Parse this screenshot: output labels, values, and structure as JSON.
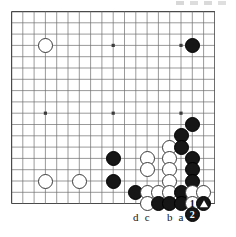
{
  "diagram": {
    "type": "go-board-problem-diagram",
    "board_size_columns": 19,
    "board_size_rows": 18,
    "visible_grid": {
      "cols": 19,
      "rows": 18
    },
    "background_color": "#ffffff",
    "line_color": "#6e6e6e",
    "border_color": "#4a4a4a",
    "black_color": "#161616",
    "white_color": "#ffffff"
  },
  "star_points": [
    {
      "col": 3,
      "row": 3
    },
    {
      "col": 9,
      "row": 3
    },
    {
      "col": 15,
      "row": 3
    },
    {
      "col": 3,
      "row": 9
    },
    {
      "col": 9,
      "row": 9
    },
    {
      "col": 15,
      "row": 9
    }
  ],
  "stones": [
    {
      "col": 3,
      "row": 3,
      "color": "white",
      "label": ""
    },
    {
      "col": 16,
      "row": 3,
      "color": "black",
      "label": ""
    },
    {
      "col": 16,
      "row": 10,
      "color": "black",
      "label": ""
    },
    {
      "col": 15,
      "row": 11,
      "color": "black",
      "label": ""
    },
    {
      "col": 14,
      "row": 12,
      "color": "white",
      "label": ""
    },
    {
      "col": 15,
      "row": 12,
      "color": "black",
      "label": ""
    },
    {
      "col": 9,
      "row": 13,
      "color": "black",
      "label": ""
    },
    {
      "col": 12,
      "row": 13,
      "color": "white",
      "label": ""
    },
    {
      "col": 14,
      "row": 13,
      "color": "white",
      "label": ""
    },
    {
      "col": 16,
      "row": 13,
      "color": "black",
      "label": ""
    },
    {
      "col": 3,
      "row": 15,
      "color": "white",
      "label": ""
    },
    {
      "col": 6,
      "row": 15,
      "color": "white",
      "label": ""
    },
    {
      "col": 9,
      "row": 15,
      "color": "black",
      "label": ""
    },
    {
      "col": 12,
      "row": 14,
      "color": "white",
      "label": ""
    },
    {
      "col": 14,
      "row": 14,
      "color": "white",
      "label": ""
    },
    {
      "col": 16,
      "row": 14,
      "color": "black",
      "label": ""
    },
    {
      "col": 14,
      "row": 15,
      "color": "white",
      "label": ""
    },
    {
      "col": 16,
      "row": 15,
      "color": "black",
      "label": ""
    },
    {
      "col": 11,
      "row": 16,
      "color": "black",
      "label": ""
    },
    {
      "col": 12,
      "row": 16,
      "color": "white",
      "label": ""
    },
    {
      "col": 13,
      "row": 16,
      "color": "white",
      "label": ""
    },
    {
      "col": 14,
      "row": 16,
      "color": "white",
      "label": ""
    },
    {
      "col": 15,
      "row": 16,
      "color": "black",
      "label": ""
    },
    {
      "col": 16,
      "row": 16,
      "color": "white",
      "label": ""
    },
    {
      "col": 17,
      "row": 16,
      "color": "white",
      "label": ""
    },
    {
      "col": 12,
      "row": 17,
      "color": "white",
      "label": ""
    },
    {
      "col": 13,
      "row": 17,
      "color": "black",
      "label": ""
    },
    {
      "col": 14,
      "row": 17,
      "color": "black",
      "label": ""
    },
    {
      "col": 15,
      "row": 17,
      "color": "black",
      "label": ""
    },
    {
      "col": 16,
      "row": 17,
      "color": "white",
      "label": "1"
    },
    {
      "col": 17,
      "row": 17,
      "color": "black",
      "label": "triangle"
    }
  ],
  "move_markers": [
    {
      "label": "1",
      "color": "white",
      "col": 16,
      "row": 17
    },
    {
      "label": "2",
      "color": "black",
      "col": 16,
      "row": 18,
      "outside": true
    }
  ],
  "coordinate_labels": [
    {
      "text": "d",
      "col": 11
    },
    {
      "text": "c",
      "col": 12
    },
    {
      "text": "b",
      "col": 14
    },
    {
      "text": "a",
      "col": 15
    }
  ],
  "captured_marker": {
    "symbol": "▲",
    "meaning": "triangle-marked-black-stone"
  }
}
